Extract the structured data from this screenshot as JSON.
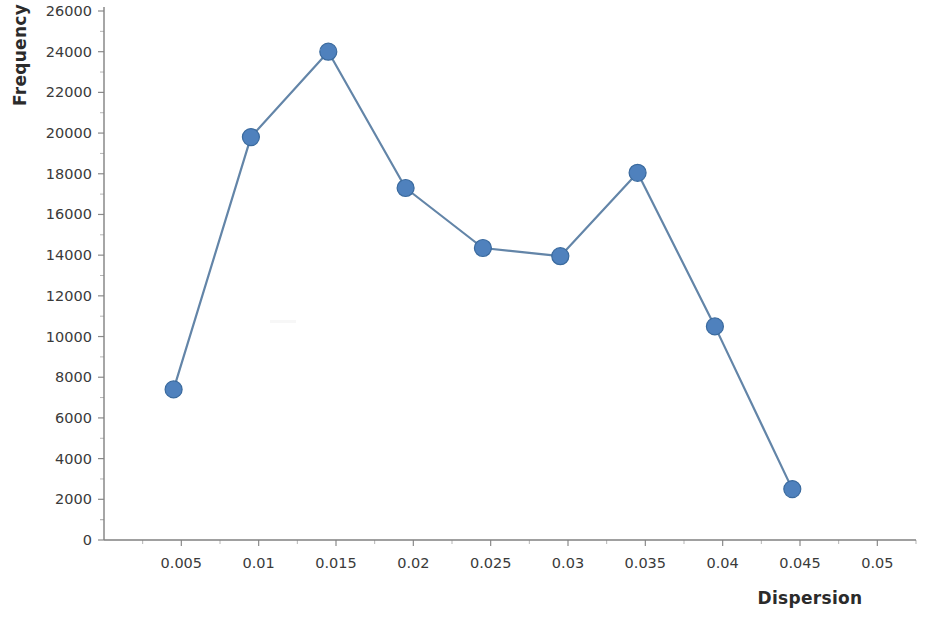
{
  "chart_data": {
    "type": "line",
    "title": "",
    "xlabel": "Dispersion",
    "ylabel": "Frequency",
    "x": [
      0.0045,
      0.0095,
      0.0145,
      0.0195,
      0.0245,
      0.0295,
      0.0345,
      0.0395,
      0.0445
    ],
    "values": [
      7400,
      19800,
      24000,
      17300,
      14350,
      13950,
      18050,
      10500,
      2500
    ],
    "series": [
      {
        "name": "Frequency",
        "x": [
          0.0045,
          0.0095,
          0.0145,
          0.0195,
          0.0245,
          0.0295,
          0.0345,
          0.0395,
          0.0445
        ],
        "values": [
          7400,
          19800,
          24000,
          17300,
          14350,
          13950,
          18050,
          10500,
          2500
        ]
      }
    ],
    "xlim": [
      0.0,
      0.0525
    ],
    "ylim": [
      0,
      26000
    ],
    "xticks": [
      0.005,
      0.01,
      0.015,
      0.02,
      0.025,
      0.03,
      0.035,
      0.04,
      0.045,
      0.05
    ],
    "xtick_labels": [
      "0.005",
      "0.01",
      "0.015",
      "0.02",
      "0.025",
      "0.03",
      "0.035",
      "0.04",
      "0.045",
      "0.05"
    ],
    "yticks": [
      0,
      2000,
      4000,
      6000,
      8000,
      10000,
      12000,
      14000,
      16000,
      18000,
      20000,
      22000,
      24000,
      26000
    ],
    "ytick_labels": [
      "0",
      "2000",
      "4000",
      "6000",
      "8000",
      "10000",
      "12000",
      "14000",
      "16000",
      "18000",
      "20000",
      "22000",
      "24000",
      "26000"
    ],
    "grid": false,
    "legend": false,
    "legend_position": "none",
    "marker": "circle",
    "colors": {
      "series": "#4F81BD",
      "marker_fill": "#4F81BD",
      "marker_stroke": "#3A6A9E",
      "line": "#6385A8",
      "axis": "#808080",
      "tick_label": "#3a3a3a",
      "axis_title": "#2b2b2b",
      "background": "#ffffff"
    }
  },
  "axes": {
    "y_title": "Frequency",
    "x_title": "Dispersion"
  }
}
